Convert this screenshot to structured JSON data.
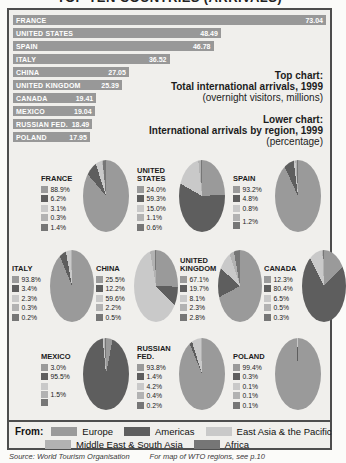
{
  "title": "TOP TEN COUNTRIES (ARRIVALS)",
  "annotations": {
    "top": {
      "heading": "Top chart:",
      "line2": "Total international arrivals, 1999",
      "line3": "(overnight visitors, millions)"
    },
    "lower": {
      "heading": "Lower chart:",
      "line2": "International arrivals by region, 1999",
      "line3": "(percentage)"
    }
  },
  "from_legend": {
    "label": "From:",
    "rows": [
      [
        0,
        1,
        2
      ],
      [
        3,
        4
      ]
    ]
  },
  "source": "Source: World Tourism Organisation",
  "source_note": "For map of WTO regions, see p.10",
  "chart_data": [
    {
      "type": "bar",
      "title": "Total international arrivals, 1999 (overnight visitors, millions)",
      "categories": [
        "FRANCE",
        "UNITED STATES",
        "SPAIN",
        "ITALY",
        "CHINA",
        "UNITED KINGDOM",
        "CANADA",
        "MEXICO",
        "RUSSIAN FED.",
        "POLAND"
      ],
      "values": [
        73.04,
        48.49,
        46.78,
        36.52,
        27.05,
        25.39,
        19.41,
        19.04,
        18.49,
        17.95
      ],
      "xlim": [
        0,
        73.04
      ],
      "bar_color": "#989898",
      "orientation": "horizontal",
      "value_labels": "inside-end"
    },
    {
      "type": "pie",
      "title": "International arrivals by region, 1999 (percentage)",
      "legend_position": "bottom",
      "regions": [
        {
          "name": "Europe",
          "color": "#9a9a9a"
        },
        {
          "name": "Americas",
          "color": "#5e5e5e"
        },
        {
          "name": "East Asia & the Pacific",
          "color": "#c9c9c9"
        },
        {
          "name": "Middle East & South Asia",
          "color": "#b2b2b2"
        },
        {
          "name": "Africa",
          "color": "#767676"
        }
      ],
      "rows": [
        [
          0,
          1,
          2
        ],
        [
          3,
          4,
          5,
          6
        ],
        [
          7,
          8,
          9
        ]
      ],
      "pies": [
        {
          "name": "FRANCE",
          "entries": [
            {
              "label": "88.9%",
              "value": 88.9,
              "regions": [
                0
              ]
            },
            {
              "label": "6.2%",
              "value": 6.2,
              "regions": [
                1
              ]
            },
            {
              "label": "3.1%",
              "value": 3.1,
              "regions": [
                2
              ]
            },
            {
              "label": "0.3%",
              "value": 0.3,
              "regions": [
                3
              ]
            },
            {
              "label": "1.4%",
              "value": 1.4,
              "regions": [
                4
              ]
            }
          ]
        },
        {
          "name": "UNITED STATES",
          "entries": [
            {
              "label": "24.0%",
              "value": 24.0,
              "regions": [
                0
              ]
            },
            {
              "label": "59.3%",
              "value": 59.3,
              "regions": [
                1
              ]
            },
            {
              "label": "15.0%",
              "value": 15.0,
              "regions": [
                2
              ]
            },
            {
              "label": "1.1%",
              "value": 1.1,
              "regions": [
                3
              ]
            },
            {
              "label": "0.6%",
              "value": 0.6,
              "regions": [
                4
              ]
            }
          ]
        },
        {
          "name": "SPAIN",
          "entries": [
            {
              "label": "93.2%",
              "value": 93.2,
              "regions": [
                0
              ]
            },
            {
              "label": "4.8%",
              "value": 4.8,
              "regions": [
                1
              ]
            },
            {
              "label": "0.8%",
              "value": 0.8,
              "regions": [
                2
              ]
            },
            {
              "label": "1.2%",
              "value": 1.2,
              "regions": [
                3,
                4
              ]
            }
          ]
        },
        {
          "name": "ITALY",
          "entries": [
            {
              "label": "93.8%",
              "value": 93.8,
              "regions": [
                0
              ]
            },
            {
              "label": "3.4%",
              "value": 3.4,
              "regions": [
                1
              ]
            },
            {
              "label": "2.3%",
              "value": 2.3,
              "regions": [
                2
              ]
            },
            {
              "label": "0.3%",
              "value": 0.3,
              "regions": [
                3
              ]
            },
            {
              "label": "0.2%",
              "value": 0.2,
              "regions": [
                4
              ]
            }
          ]
        },
        {
          "name": "CHINA",
          "entries": [
            {
              "label": "25.5%",
              "value": 25.5,
              "regions": [
                0
              ]
            },
            {
              "label": "12.2%",
              "value": 12.2,
              "regions": [
                1
              ]
            },
            {
              "label": "59.6%",
              "value": 59.6,
              "regions": [
                2
              ]
            },
            {
              "label": "2.2%",
              "value": 2.2,
              "regions": [
                3
              ]
            },
            {
              "label": "0.5%",
              "value": 0.5,
              "regions": [
                4
              ]
            }
          ]
        },
        {
          "name": "UNITED KINGDOM",
          "entries": [
            {
              "label": "67.1%",
              "value": 67.1,
              "regions": [
                0
              ]
            },
            {
              "label": "19.7%",
              "value": 19.7,
              "regions": [
                1
              ]
            },
            {
              "label": "8.1%",
              "value": 8.1,
              "regions": [
                2
              ]
            },
            {
              "label": "2.3%",
              "value": 2.3,
              "regions": [
                3
              ]
            },
            {
              "label": "2.8%",
              "value": 2.8,
              "regions": [
                4
              ]
            }
          ]
        },
        {
          "name": "CANADA",
          "entries": [
            {
              "label": "12.3%",
              "value": 12.3,
              "regions": [
                0
              ]
            },
            {
              "label": "80.4%",
              "value": 80.4,
              "regions": [
                1
              ]
            },
            {
              "label": "6.5%",
              "value": 6.5,
              "regions": [
                2
              ]
            },
            {
              "label": "0.5%",
              "value": 0.5,
              "regions": [
                3
              ]
            },
            {
              "label": "0.3%",
              "value": 0.3,
              "regions": [
                4
              ]
            }
          ]
        },
        {
          "name": "MEXICO",
          "entries": [
            {
              "label": "3.0%",
              "value": 3.0,
              "regions": [
                0
              ]
            },
            {
              "label": "95.5%",
              "value": 95.5,
              "regions": [
                1
              ]
            },
            {
              "label": "1.5%",
              "value": 1.5,
              "regions": [
                2,
                3,
                4
              ]
            }
          ]
        },
        {
          "name": "RUSSIAN FED.",
          "entries": [
            {
              "label": "93.8%",
              "value": 93.8,
              "regions": [
                0
              ]
            },
            {
              "label": "1.4%",
              "value": 1.4,
              "regions": [
                1
              ]
            },
            {
              "label": "4.2%",
              "value": 4.2,
              "regions": [
                2
              ]
            },
            {
              "label": "0.4%",
              "value": 0.4,
              "regions": [
                3
              ]
            },
            {
              "label": "0.2%",
              "value": 0.2,
              "regions": [
                4
              ]
            }
          ]
        },
        {
          "name": "POLAND",
          "entries": [
            {
              "label": "99.4%",
              "value": 99.4,
              "regions": [
                0
              ]
            },
            {
              "label": "0.3%",
              "value": 0.3,
              "regions": [
                1
              ]
            },
            {
              "label": "0.1%",
              "value": 0.1,
              "regions": [
                2
              ]
            },
            {
              "label": "0.1%",
              "value": 0.1,
              "regions": [
                3
              ]
            },
            {
              "label": "0.1%",
              "value": 0.1,
              "regions": [
                4
              ]
            }
          ]
        }
      ]
    }
  ]
}
